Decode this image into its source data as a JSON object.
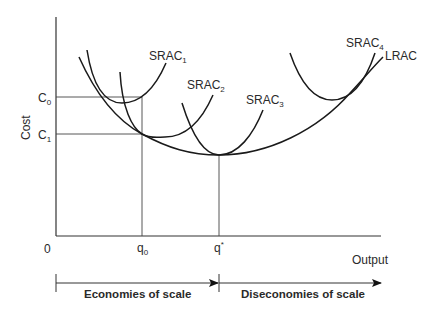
{
  "diagram": {
    "type": "economics-cost-curves",
    "axes": {
      "ylabel": "Cost",
      "xlabel": "Output",
      "origin": "0",
      "y_ticks": [
        {
          "main": "C",
          "sub": "0"
        },
        {
          "main": "C",
          "sub": "1"
        }
      ],
      "x_ticks": [
        {
          "main": "q",
          "sub": "0"
        },
        {
          "main": "q",
          "sup": "*"
        }
      ]
    },
    "curves": [
      {
        "id": "srac1",
        "main": "SRAC",
        "sub": "1"
      },
      {
        "id": "srac2",
        "main": "SRAC",
        "sub": "2"
      },
      {
        "id": "srac3",
        "main": "SRAC",
        "sub": "3"
      },
      {
        "id": "srac4",
        "main": "SRAC",
        "sub": "4"
      },
      {
        "id": "lrac",
        "main": "LRAC"
      }
    ],
    "regions": {
      "left": "Economies of scale",
      "right": "Diseconomies of scale"
    }
  }
}
